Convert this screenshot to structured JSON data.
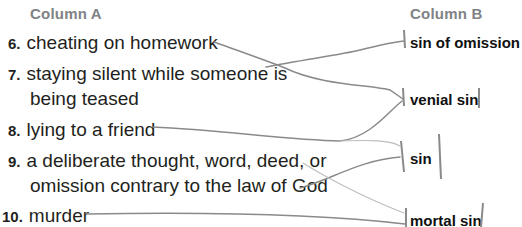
{
  "column_a": {
    "header": "Column A",
    "items": [
      {
        "number": "6.",
        "text": "cheating on homework"
      },
      {
        "number": "7.",
        "text": "staying silent while someone is",
        "text2": "being teased"
      },
      {
        "number": "8.",
        "text": "lying to a friend"
      },
      {
        "number": "9.",
        "text": "a deliberate thought, word, deed, or",
        "text2": "omission contrary to the law of God"
      },
      {
        "number": "10.",
        "text": "murder"
      }
    ]
  },
  "column_b": {
    "header": "Column B",
    "terms": [
      "sin of omission",
      "venial sin",
      "sin",
      "mortal sin"
    ]
  },
  "matches": [
    {
      "item": "6",
      "term": "venial sin"
    },
    {
      "item": "7",
      "term": "sin of omission"
    },
    {
      "item": "8",
      "term": "venial sin"
    },
    {
      "item": "9",
      "term": "sin"
    },
    {
      "item": "10",
      "term": "mortal sin"
    }
  ],
  "colors": {
    "header": "#808285",
    "text": "#231f20",
    "pencil": "#8a8a8a"
  }
}
